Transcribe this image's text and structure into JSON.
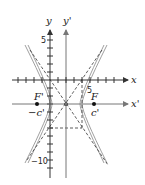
{
  "diagram": {
    "type": "translated-hyperbola",
    "axes": {
      "x_label": "x",
      "y_label": "y",
      "x_prime_label": "x'",
      "y_prime_label": "y'"
    },
    "tick_labels": {
      "y_five": "5",
      "y_neg_ten": "−10",
      "x_five": "5"
    },
    "foci": {
      "left_label": "F'",
      "right_label": "F",
      "left_coord_label": "−c'",
      "right_coord_label": "c'"
    },
    "colors": {
      "axis": "#333333",
      "curve": "#9a9a9a",
      "dash": "#333333"
    }
  }
}
